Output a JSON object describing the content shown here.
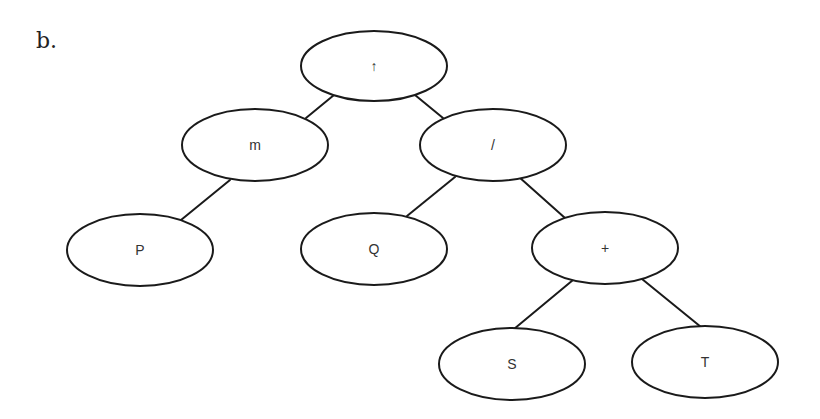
{
  "figure": {
    "label": "b.",
    "type": "binary expression tree"
  },
  "style": {
    "stroke_color": "#1a1a1a",
    "node_fill": "#ffffff",
    "text_color": "#333333"
  },
  "nodes": [
    {
      "id": "root",
      "label": "↑",
      "cx": 374,
      "cy": 66,
      "rx": 73,
      "ry": 35
    },
    {
      "id": "m",
      "label": "m",
      "cx": 255,
      "cy": 145,
      "rx": 73,
      "ry": 36
    },
    {
      "id": "div",
      "label": "/",
      "cx": 493,
      "cy": 145,
      "rx": 73,
      "ry": 36
    },
    {
      "id": "P",
      "label": "P",
      "cx": 140,
      "cy": 250,
      "rx": 73,
      "ry": 36
    },
    {
      "id": "Q",
      "label": "Q",
      "cx": 374,
      "cy": 249,
      "rx": 73,
      "ry": 36
    },
    {
      "id": "plus",
      "label": "+",
      "cx": 605,
      "cy": 248,
      "rx": 73,
      "ry": 36
    },
    {
      "id": "S",
      "label": "S",
      "cx": 512,
      "cy": 364,
      "rx": 73,
      "ry": 36
    },
    {
      "id": "T",
      "label": "T",
      "cx": 705,
      "cy": 362,
      "rx": 73,
      "ry": 36
    }
  ],
  "edges": [
    {
      "from": "root",
      "to": "m",
      "x1": 334,
      "y1": 95,
      "x2": 306,
      "y2": 118
    },
    {
      "from": "root",
      "to": "div",
      "x1": 415,
      "y1": 95,
      "x2": 443,
      "y2": 118
    },
    {
      "from": "m",
      "to": "P",
      "x1": 230,
      "y1": 180,
      "x2": 181,
      "y2": 220
    },
    {
      "from": "div",
      "to": "Q",
      "x1": 455,
      "y1": 177,
      "x2": 407,
      "y2": 216
    },
    {
      "from": "div",
      "to": "plus",
      "x1": 519,
      "y1": 177,
      "x2": 565,
      "y2": 218
    },
    {
      "from": "plus",
      "to": "S",
      "x1": 573,
      "y1": 280,
      "x2": 514,
      "y2": 329
    },
    {
      "from": "plus",
      "to": "T",
      "x1": 642,
      "y1": 279,
      "x2": 701,
      "y2": 327
    }
  ]
}
